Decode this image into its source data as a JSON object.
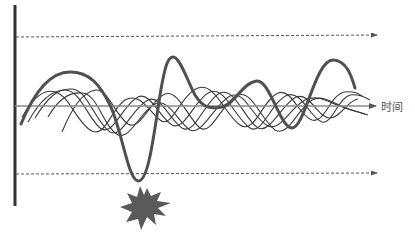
{
  "diagram": {
    "axis_label": "时间",
    "colors": {
      "vertical_axis": "#333333",
      "time_axis": "#8a8a8a",
      "dashed_limits": "#555555",
      "thick_curve": "#505050",
      "thin_curves": "#3a3a3a",
      "starburst": "#5a5a5a"
    },
    "elements": [
      "vertical-axis",
      "upper-threshold-dashed-arrow",
      "time-axis-arrow",
      "lower-threshold-dashed-arrow",
      "thick-oscillating-curve",
      "thin-oscillating-curves",
      "starburst-breach-marker"
    ]
  }
}
